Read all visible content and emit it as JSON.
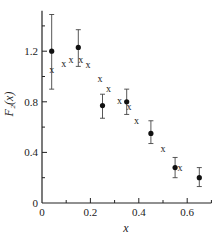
{
  "chart_data": {
    "type": "scatter",
    "title": "",
    "xlabel": "x",
    "ylabel": "F₂(x)",
    "xlim": [
      0,
      0.7
    ],
    "ylim": [
      0,
      1.52
    ],
    "grid": false,
    "x_ticks_major": [
      0,
      0.2,
      0.4,
      0.6
    ],
    "x_tick_labels": [
      "0",
      "0.2",
      "0.4",
      "0.6"
    ],
    "x_ticks_minor": [
      0.1,
      0.3,
      0.5,
      0.7
    ],
    "y_ticks_major": [
      0,
      0.4,
      0.8,
      1.2
    ],
    "y_tick_labels": [
      "0",
      "0.4",
      "0.8",
      "1.2"
    ],
    "y_ticks_minor": [
      0.2,
      0.6,
      1.0,
      1.4
    ],
    "series": [
      {
        "name": "data",
        "marker": "filled-circle",
        "points": [
          {
            "x": 0.04,
            "y": 1.2,
            "y_low": 0.9,
            "y_high": 1.49
          },
          {
            "x": 0.15,
            "y": 1.23,
            "y_low": 1.08,
            "y_high": 1.37
          },
          {
            "x": 0.25,
            "y": 0.77,
            "y_low": 0.67,
            "y_high": 0.86
          },
          {
            "x": 0.35,
            "y": 0.8,
            "y_low": 0.7,
            "y_high": 0.9
          },
          {
            "x": 0.45,
            "y": 0.55,
            "y_low": 0.47,
            "y_high": 0.65
          },
          {
            "x": 0.55,
            "y": 0.28,
            "y_low": 0.2,
            "y_high": 0.36
          },
          {
            "x": 0.65,
            "y": 0.2,
            "y_low": 0.13,
            "y_high": 0.28
          }
        ]
      },
      {
        "name": "model",
        "marker": "x",
        "points": [
          {
            "x": 0.04,
            "y": 1.05
          },
          {
            "x": 0.09,
            "y": 1.1
          },
          {
            "x": 0.12,
            "y": 1.13
          },
          {
            "x": 0.16,
            "y": 1.13
          },
          {
            "x": 0.19,
            "y": 1.09
          },
          {
            "x": 0.24,
            "y": 0.98
          },
          {
            "x": 0.275,
            "y": 0.9
          },
          {
            "x": 0.32,
            "y": 0.81
          },
          {
            "x": 0.36,
            "y": 0.76
          },
          {
            "x": 0.39,
            "y": 0.645
          },
          {
            "x": 0.5,
            "y": 0.425
          },
          {
            "x": 0.57,
            "y": 0.275
          }
        ]
      }
    ],
    "x_marker_glyph": "x"
  }
}
